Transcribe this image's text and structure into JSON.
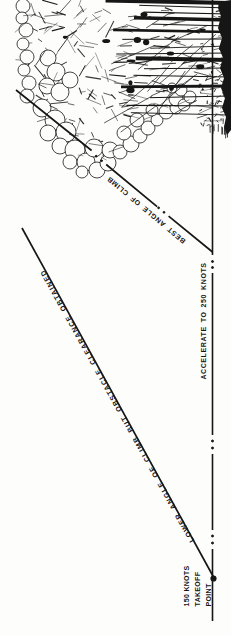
{
  "diagram": {
    "labels": {
      "best_angle": "BEST ANGLE OF CLIMB",
      "lower_angle": "LOWER ANGLE OF CLIMB BUT OBSTACLE CLEARANCE OBTAINED",
      "accelerate": "ACCELERATE TO 250 KNOTS",
      "takeoff_line1": "150 KNOTS",
      "takeoff_line2": "TAKEOFF",
      "takeoff_line3": "POINT"
    },
    "colors": {
      "ink": "#161616",
      "background": "#fdfdfb"
    }
  }
}
